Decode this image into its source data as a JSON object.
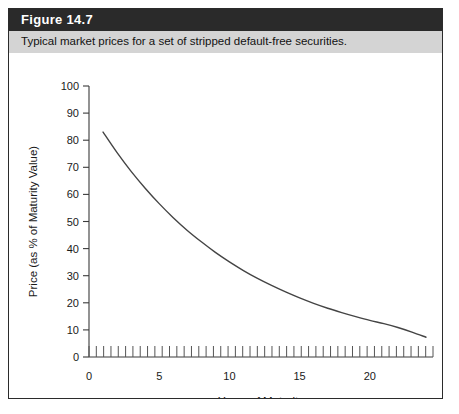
{
  "figure": {
    "number_label": "Figure 14.7",
    "caption": "Typical market prices for a set of stripped default-free securities."
  },
  "colors": {
    "title_bar_background": "#2a2a2a",
    "title_text": "#ffffff",
    "caption_bar_background": "#d4d4d4",
    "caption_text": "#111111",
    "frame_border": "#2b2b2b",
    "plot_background": "#ffffff",
    "curve": "#444444",
    "axis": "#3a3a3a"
  },
  "chart_data": {
    "type": "line",
    "title": "",
    "subtitle": "",
    "xlabel": "Years of Maturity",
    "ylabel": "Price (as % of Maturity Value)",
    "xlim": [
      0,
      24.5
    ],
    "ylim": [
      0,
      100
    ],
    "xticks": [
      0,
      5,
      10,
      15,
      20
    ],
    "xtick_labels": [
      "0",
      "5",
      "10",
      "15",
      "20"
    ],
    "yticks": [
      0,
      10,
      20,
      30,
      40,
      50,
      60,
      70,
      80,
      90,
      100
    ],
    "ytick_labels": [
      "0",
      "10",
      "20",
      "30",
      "40",
      "50",
      "60",
      "70",
      "80",
      "90",
      "100"
    ],
    "grid": false,
    "legend": null,
    "minor_xticks_count": 47,
    "series": [
      {
        "name": "Stripped default-free security price",
        "x": [
          1,
          2,
          3,
          4,
          5,
          6,
          7,
          8,
          9,
          10,
          11,
          12,
          13,
          14,
          15,
          16,
          17,
          18,
          19,
          20,
          21,
          22,
          23,
          24
        ],
        "values": [
          83.0,
          75.4,
          68.5,
          62.3,
          56.6,
          51.4,
          46.7,
          42.5,
          38.6,
          35.1,
          31.9,
          29.0,
          26.4,
          24.0,
          21.8,
          19.8,
          18.0,
          16.4,
          14.9,
          13.5,
          12.3,
          10.9,
          9.2,
          7.3
        ]
      }
    ],
    "annotations": []
  }
}
